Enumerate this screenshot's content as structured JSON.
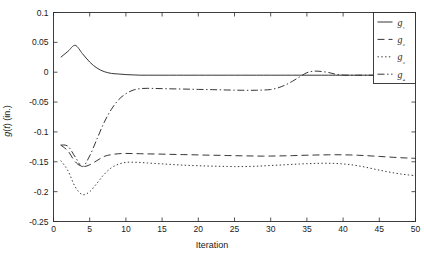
{
  "chart_data": {
    "type": "line",
    "title": "",
    "xlabel": "Iteration",
    "ylabel": "g(t) (in.)",
    "xlim": [
      0,
      50
    ],
    "ylim": [
      -0.25,
      0.1
    ],
    "xticks": [
      0,
      5,
      10,
      15,
      20,
      25,
      30,
      35,
      40,
      45,
      50
    ],
    "yticks": [
      0.1,
      0.05,
      0,
      -0.05,
      -0.1,
      -0.15,
      -0.2,
      -0.25
    ],
    "xtick_labels": [
      "0",
      "5",
      "10",
      "15",
      "20",
      "25",
      "30",
      "35",
      "40",
      "45",
      "50"
    ],
    "ytick_labels": [
      "0.1",
      "0.05",
      "0",
      "-0.05",
      "-0.1",
      "-0.15",
      "-0.2",
      "-0.25"
    ],
    "grid": false,
    "legend_position": "top-right",
    "line_color": "#2b2b2b",
    "x": [
      1,
      2,
      3,
      4,
      5,
      6,
      7,
      8,
      9,
      10,
      11,
      12,
      13,
      14,
      15,
      16,
      17,
      18,
      19,
      20,
      21,
      22,
      23,
      24,
      25,
      26,
      27,
      28,
      29,
      30,
      31,
      32,
      33,
      34,
      35,
      36,
      37,
      38,
      39,
      40,
      41,
      42,
      43,
      44,
      45,
      46,
      47,
      48,
      49,
      50
    ],
    "series": [
      {
        "name": "g1",
        "label": "g₁",
        "dash": "solid",
        "values": [
          0.025,
          0.035,
          0.045,
          0.031,
          0.017,
          0.007,
          0.001,
          -0.002,
          -0.003,
          -0.004,
          -0.0045,
          -0.005,
          -0.005,
          -0.005,
          -0.005,
          -0.005,
          -0.005,
          -0.005,
          -0.005,
          -0.005,
          -0.005,
          -0.005,
          -0.005,
          -0.005,
          -0.005,
          -0.005,
          -0.005,
          -0.005,
          -0.005,
          -0.005,
          -0.005,
          -0.005,
          -0.005,
          -0.005,
          -0.005,
          -0.005,
          -0.005,
          -0.005,
          -0.005,
          -0.005,
          -0.005,
          -0.005,
          -0.005,
          -0.005,
          -0.005,
          -0.005,
          -0.005,
          -0.005,
          -0.005,
          -0.005
        ]
      },
      {
        "name": "g2",
        "label": "g₂",
        "dash": "dashed",
        "values": [
          -0.122,
          -0.132,
          -0.15,
          -0.158,
          -0.155,
          -0.148,
          -0.141,
          -0.138,
          -0.1365,
          -0.136,
          -0.1362,
          -0.1365,
          -0.1368,
          -0.137,
          -0.1372,
          -0.1375,
          -0.1378,
          -0.138,
          -0.1382,
          -0.1385,
          -0.1388,
          -0.139,
          -0.1392,
          -0.1395,
          -0.1398,
          -0.14,
          -0.1402,
          -0.1404,
          -0.1405,
          -0.1404,
          -0.1402,
          -0.14,
          -0.1397,
          -0.1393,
          -0.139,
          -0.1387,
          -0.1385,
          -0.1383,
          -0.1382,
          -0.1383,
          -0.1386,
          -0.139,
          -0.1396,
          -0.1403,
          -0.141,
          -0.1418,
          -0.1425,
          -0.1432,
          -0.1438,
          -0.1443
        ]
      },
      {
        "name": "g3",
        "label": "g₃",
        "dash": "dotted",
        "values": [
          -0.148,
          -0.165,
          -0.192,
          -0.205,
          -0.2,
          -0.186,
          -0.171,
          -0.16,
          -0.154,
          -0.151,
          -0.1508,
          -0.1512,
          -0.152,
          -0.1528,
          -0.1535,
          -0.1543,
          -0.155,
          -0.1557,
          -0.1562,
          -0.1566,
          -0.157,
          -0.1573,
          -0.1576,
          -0.1578,
          -0.158,
          -0.158,
          -0.1578,
          -0.1574,
          -0.1568,
          -0.1562,
          -0.1556,
          -0.155,
          -0.1543,
          -0.1537,
          -0.1532,
          -0.1528,
          -0.1525,
          -0.1524,
          -0.1528,
          -0.1536,
          -0.1548,
          -0.1566,
          -0.1588,
          -0.1614,
          -0.164,
          -0.1664,
          -0.1686,
          -0.1705,
          -0.172,
          -0.1732
        ]
      },
      {
        "name": "g4",
        "label": "g₄",
        "dash": "dashdot",
        "values": [
          -0.122,
          -0.124,
          -0.142,
          -0.158,
          -0.14,
          -0.112,
          -0.084,
          -0.062,
          -0.046,
          -0.036,
          -0.03,
          -0.0275,
          -0.027,
          -0.0272,
          -0.0275,
          -0.0278,
          -0.028,
          -0.0282,
          -0.0285,
          -0.0288,
          -0.029,
          -0.0292,
          -0.0295,
          -0.0298,
          -0.03,
          -0.0302,
          -0.0303,
          -0.0302,
          -0.0298,
          -0.029,
          -0.0262,
          -0.0215,
          -0.0152,
          -0.0078,
          -0.0008,
          0.0018,
          0.0012,
          -0.0005,
          -0.0035,
          -0.0048,
          -0.005,
          -0.005,
          -0.005,
          -0.005,
          -0.005,
          -0.005,
          -0.005,
          -0.005,
          -0.005,
          -0.005
        ]
      }
    ]
  },
  "legend": {
    "entries": [
      {
        "label": "g₁",
        "style": "solid"
      },
      {
        "label": "g₂",
        "style": "dashed"
      },
      {
        "label": "g₃",
        "style": "dotted"
      },
      {
        "label": "g₄",
        "style": "dashdot"
      }
    ]
  }
}
